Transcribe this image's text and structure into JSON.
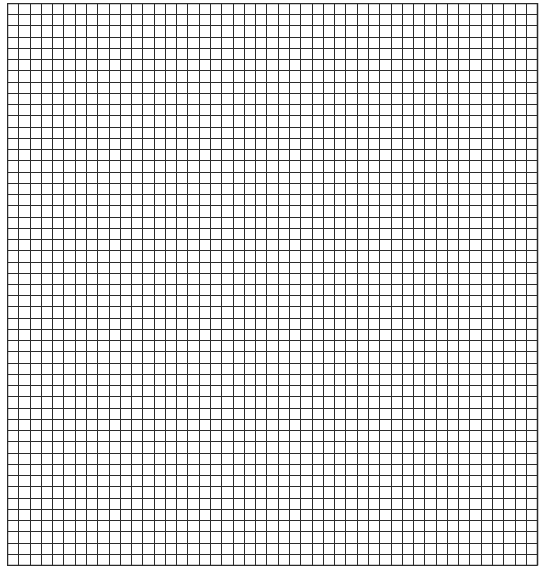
{
  "grid": {
    "columns": 47,
    "rows": 50,
    "cell_width": 11.28,
    "cell_height": 11.24,
    "line_color": "#2b2b2b",
    "background": "#ffffff",
    "origin_x": 7,
    "origin_y": 3
  }
}
